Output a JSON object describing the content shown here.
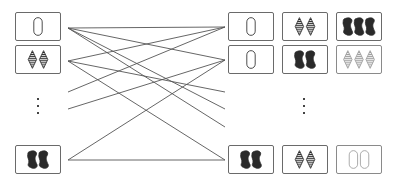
{
  "colors": {
    "stroke": "#6a6a6a",
    "ink": "#2a2a2a",
    "line": "#555555",
    "light": "#9a9a9a"
  },
  "diagram": {
    "left_cards": [
      {
        "id": "L1",
        "count": 1,
        "shape": "oval",
        "shading": "open",
        "x": 15,
        "y": 12,
        "anchor_y": 28
      },
      {
        "id": "L2",
        "count": 2,
        "shape": "diamond",
        "shading": "striped",
        "x": 15,
        "y": 45,
        "anchor_y": 61
      },
      {
        "id": "L3",
        "count": 2,
        "shape": "squiggle",
        "shading": "solid",
        "x": 15,
        "y": 145,
        "anchor_y": 160
      }
    ],
    "left_ellipsis": {
      "x": 37,
      "ys": [
        98,
        105,
        112
      ]
    },
    "right_rows": [
      {
        "id": "R1",
        "y": 12,
        "anchor_y": 27,
        "cards": [
          {
            "count": 1,
            "shape": "oval",
            "shading": "open"
          },
          {
            "count": 2,
            "shape": "diamond",
            "shading": "striped"
          },
          {
            "count": 3,
            "shape": "squiggle",
            "shading": "solid"
          }
        ]
      },
      {
        "id": "R2",
        "y": 45,
        "anchor_y": 60,
        "cards": [
          {
            "count": 1,
            "shape": "oval",
            "shading": "open"
          },
          {
            "count": 2,
            "shape": "squiggle",
            "shading": "solid"
          },
          {
            "count": 3,
            "shape": "diamond",
            "shading": "striped",
            "faded": true
          }
        ]
      },
      {
        "id": "R3",
        "y": 145,
        "anchor_y": 160,
        "cards": [
          {
            "count": 2,
            "shape": "squiggle",
            "shading": "solid"
          },
          {
            "count": 2,
            "shape": "diamond",
            "shading": "striped"
          },
          {
            "count": 2,
            "shape": "oval",
            "shading": "open",
            "faded": true
          }
        ]
      }
    ],
    "right_columns_x": [
      228,
      282,
      336
    ],
    "right_ellipsis": {
      "x": 303,
      "ys": [
        98,
        105,
        112
      ]
    },
    "edges": [
      {
        "from": [
          68,
          28
        ],
        "to": [
          225,
          27
        ]
      },
      {
        "from": [
          68,
          28
        ],
        "to": [
          225,
          60
        ]
      },
      {
        "from": [
          68,
          28
        ],
        "to": [
          225,
          109
        ]
      },
      {
        "from": [
          68,
          28
        ],
        "to": [
          225,
          127
        ]
      },
      {
        "from": [
          68,
          61
        ],
        "to": [
          225,
          27
        ]
      },
      {
        "from": [
          68,
          61
        ],
        "to": [
          225,
          92
        ]
      },
      {
        "from": [
          68,
          61
        ],
        "to": [
          225,
          160
        ]
      },
      {
        "from": [
          68,
          92
        ],
        "to": [
          225,
          27
        ]
      },
      {
        "from": [
          68,
          109
        ],
        "to": [
          225,
          60
        ]
      },
      {
        "from": [
          68,
          160
        ],
        "to": [
          225,
          60
        ]
      },
      {
        "from": [
          68,
          160
        ],
        "to": [
          225,
          160
        ]
      }
    ]
  }
}
